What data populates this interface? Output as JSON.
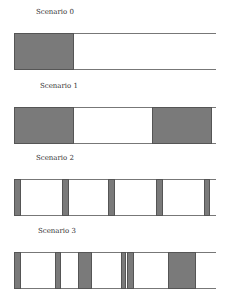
{
  "domain_extent": [
    0,
    1
  ],
  "fill_color": "#7a7a7a",
  "border_color": "#555555",
  "line_color": "#777777",
  "scenarios": [
    {
      "title": "Scenario 0",
      "blocks": [
        [
          0.0,
          0.297
        ]
      ]
    },
    {
      "title": "Scenario 1",
      "blocks": [
        [
          0.0,
          0.297
        ],
        [
          0.683,
          0.98
        ]
      ]
    },
    {
      "title": "Scenario 2",
      "blocks": [
        [
          0.0,
          0.035
        ],
        [
          0.238,
          0.272
        ],
        [
          0.465,
          0.5
        ],
        [
          0.703,
          0.738
        ],
        [
          0.941,
          0.97
        ]
      ]
    },
    {
      "title": "Scenario 3",
      "blocks": [
        [
          0.0,
          0.035
        ],
        [
          0.203,
          0.233
        ],
        [
          0.317,
          0.386
        ],
        [
          0.53,
          0.555
        ],
        [
          0.559,
          0.594
        ],
        [
          0.762,
          0.901
        ]
      ]
    }
  ]
}
